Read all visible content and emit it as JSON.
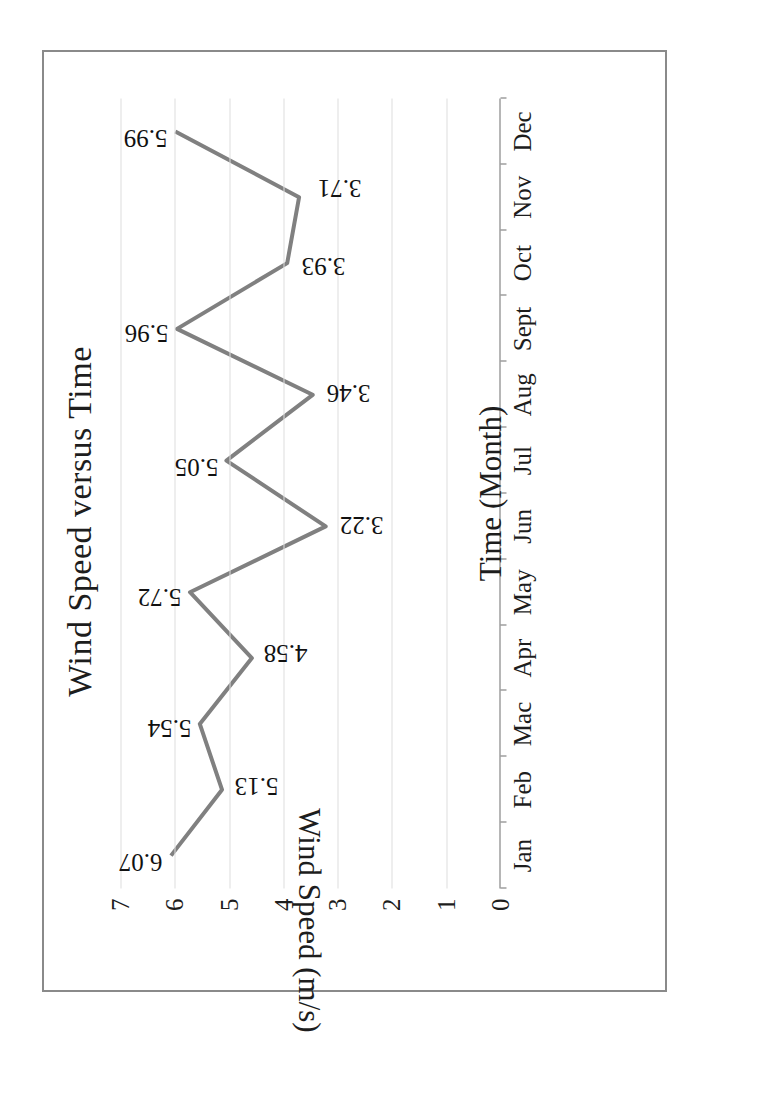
{
  "chart_data": {
    "type": "line",
    "title": "Wind Speed versus Time",
    "xlabel": "Time (Month)",
    "ylabel": "Wind Speed (m/s)",
    "categories": [
      "Jan",
      "Feb",
      "Mac",
      "Apr",
      "May",
      "Jun",
      "Jul",
      "Aug",
      "Sept",
      "Oct",
      "Nov",
      "Dec"
    ],
    "values": [
      6.07,
      5.13,
      5.54,
      4.58,
      5.72,
      3.22,
      5.05,
      3.46,
      5.96,
      3.93,
      3.71,
      5.99
    ],
    "point_labels": [
      "6.07",
      "5.13",
      "5.54",
      "4.58",
      "5.72",
      "3.22",
      "5.05",
      "3.46",
      "5.96",
      "3.93",
      "3.71",
      "5.99"
    ],
    "ylim": [
      0,
      7
    ],
    "yticks": [
      0,
      1,
      2,
      3,
      4,
      5,
      6,
      7
    ],
    "ytick_labels": [
      "0",
      "1",
      "2",
      "3",
      "4",
      "5",
      "6",
      "7"
    ],
    "grid": true,
    "legend": false,
    "series_color": "#808080",
    "axis_color": "#6f6f6f",
    "grid_color": "#dddddd",
    "frame_color": "#8a8a8a",
    "page_rotation_degrees": -90,
    "ylabel_rotation_degrees": 180
  },
  "figure": {
    "border_visible": true
  }
}
